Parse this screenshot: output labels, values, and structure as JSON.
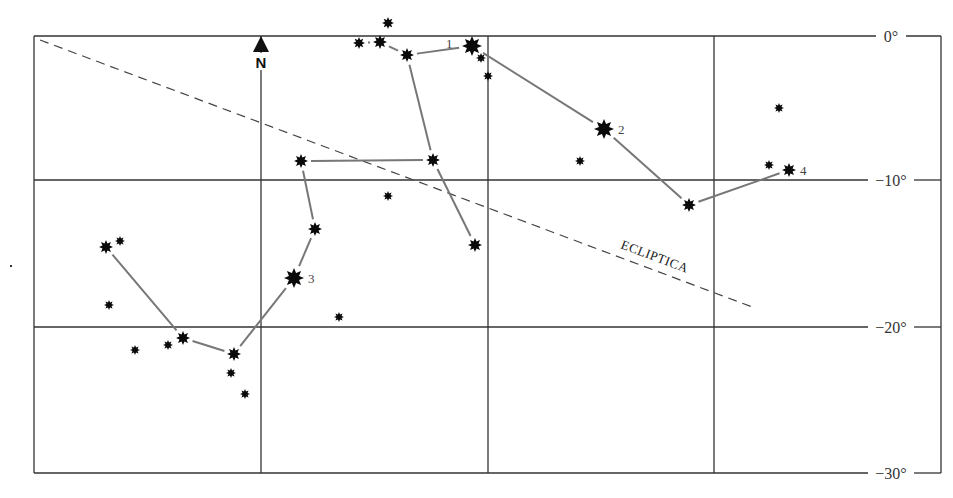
{
  "diagram": {
    "type": "star-chart",
    "frame": {
      "left": 34,
      "top": 36,
      "right": 941,
      "bottom": 473
    },
    "grid": {
      "vertical_lines_x": [
        261,
        488,
        714
      ],
      "horizontal_lines": [
        {
          "y": 36,
          "label": "0°"
        },
        {
          "y": 180,
          "label": "−10°"
        },
        {
          "y": 327,
          "label": "−20°"
        },
        {
          "y": 473,
          "label": "−30°"
        }
      ]
    },
    "north_marker": {
      "label": "N",
      "x": 261,
      "y": 36
    },
    "ecliptic": {
      "label": "ECLIPTICA",
      "from": [
        40,
        40
      ],
      "to": [
        755,
        308
      ],
      "label_pos": [
        620,
        248
      ],
      "label_angle": 20.5
    },
    "stars": [
      {
        "id": "s1",
        "x": 472,
        "y": 46,
        "size": 10,
        "label": "1"
      },
      {
        "id": "s2",
        "x": 604,
        "y": 129,
        "size": 10,
        "label": "2"
      },
      {
        "id": "s3",
        "x": 294,
        "y": 278,
        "size": 10,
        "label": "3"
      },
      {
        "id": "s4",
        "x": 789,
        "y": 170,
        "size": 7,
        "label": "4"
      },
      {
        "id": "a1",
        "x": 388,
        "y": 23,
        "size": 6
      },
      {
        "id": "a2",
        "x": 359,
        "y": 43,
        "size": 6
      },
      {
        "id": "a3",
        "x": 380,
        "y": 42,
        "size": 7
      },
      {
        "id": "a4",
        "x": 407,
        "y": 55,
        "size": 7
      },
      {
        "id": "a5",
        "x": 481,
        "y": 58,
        "size": 5
      },
      {
        "id": "a6",
        "x": 488,
        "y": 76,
        "size": 5
      },
      {
        "id": "a7",
        "x": 433,
        "y": 160,
        "size": 7
      },
      {
        "id": "a8",
        "x": 301,
        "y": 161,
        "size": 7
      },
      {
        "id": "a9",
        "x": 388,
        "y": 196,
        "size": 5
      },
      {
        "id": "a10",
        "x": 475,
        "y": 245,
        "size": 7
      },
      {
        "id": "a11",
        "x": 315,
        "y": 229,
        "size": 7
      },
      {
        "id": "a12",
        "x": 339,
        "y": 317,
        "size": 5
      },
      {
        "id": "a13",
        "x": 580,
        "y": 161,
        "size": 5
      },
      {
        "id": "a14",
        "x": 689,
        "y": 205,
        "size": 7
      },
      {
        "id": "a15",
        "x": 769,
        "y": 165,
        "size": 5
      },
      {
        "id": "a16",
        "x": 779,
        "y": 108,
        "size": 5
      },
      {
        "id": "a17",
        "x": 106,
        "y": 247,
        "size": 7
      },
      {
        "id": "a18",
        "x": 120,
        "y": 241,
        "size": 5
      },
      {
        "id": "a19",
        "x": 109,
        "y": 305,
        "size": 5
      },
      {
        "id": "a20",
        "x": 183,
        "y": 338,
        "size": 7
      },
      {
        "id": "a21",
        "x": 168,
        "y": 345,
        "size": 5
      },
      {
        "id": "a22",
        "x": 135,
        "y": 350,
        "size": 5
      },
      {
        "id": "a23",
        "x": 234,
        "y": 354,
        "size": 7
      },
      {
        "id": "a24",
        "x": 231,
        "y": 373,
        "size": 5
      },
      {
        "id": "a25",
        "x": 245,
        "y": 394,
        "size": 5
      }
    ],
    "lines": [
      [
        "a3",
        "a4"
      ],
      [
        "a4",
        "s1"
      ],
      [
        "a4",
        "a7"
      ],
      [
        "a7",
        "a10"
      ],
      [
        "a7",
        "a8"
      ],
      [
        "a8",
        "a11"
      ],
      [
        "a11",
        "s3"
      ],
      [
        "s3",
        "a23"
      ],
      [
        "a23",
        "a20"
      ],
      [
        "a20",
        "a17"
      ],
      [
        "s1",
        "s2"
      ],
      [
        "s2",
        "a14"
      ],
      [
        "a14",
        "s4"
      ],
      [
        "a2",
        "a3"
      ]
    ],
    "stray_mark": {
      "x": 10,
      "y": 265
    }
  }
}
